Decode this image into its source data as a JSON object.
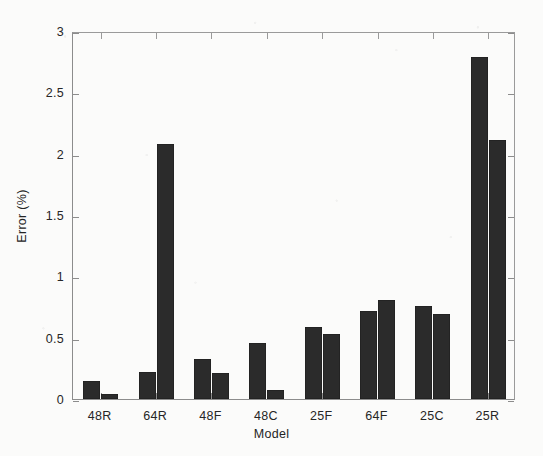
{
  "chart_data": {
    "type": "bar",
    "title": "",
    "xlabel": "Model",
    "ylabel": "Error (%)",
    "categories": [
      "48R",
      "64R",
      "48F",
      "48C",
      "25F",
      "64F",
      "25C",
      "25R"
    ],
    "series": [
      {
        "name": "series-1",
        "values": [
          0.15,
          0.22,
          0.33,
          0.46,
          0.59,
          0.72,
          0.76,
          2.79
        ]
      },
      {
        "name": "series-2",
        "values": [
          0.04,
          2.08,
          0.21,
          0.07,
          0.53,
          0.81,
          0.69,
          2.11
        ]
      }
    ],
    "ylim": [
      0,
      3
    ],
    "yticks": [
      0,
      0.5,
      1,
      1.5,
      2,
      2.5,
      3
    ],
    "ytick_labels": [
      "0",
      "0.5",
      "1",
      "1.5",
      "2",
      "2.5",
      "3"
    ],
    "grid": false,
    "legend": "none",
    "bar_color": "#2b2b2b",
    "axis_color": "#8c8c8c",
    "background_color": "#fbfbfa"
  }
}
